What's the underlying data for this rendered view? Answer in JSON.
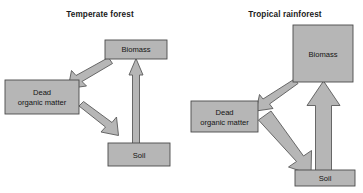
{
  "figure": {
    "type": "diagram",
    "width": 363,
    "height": 193,
    "background_color": "#ffffff",
    "box_fill_color": "#b6b6b6",
    "box_border_color": "#4a4a4a",
    "arrow_fill_color": "#b6b6b6",
    "arrow_border_color": "#5a5a5a"
  },
  "panels": [
    {
      "id": "temperate",
      "title": "Temperate forest",
      "title_x": 100,
      "title_y": 17,
      "boxes": [
        {
          "id": "temperate-biomass",
          "label": "Biomass",
          "lines": [
            "Biomass"
          ],
          "x": 105,
          "y": 40,
          "w": 62,
          "h": 19,
          "relative_size": "small"
        },
        {
          "id": "temperate-dead-organic-matter",
          "label": "Dead organic matter",
          "lines": [
            "Dead",
            "organic matter"
          ],
          "x": 5,
          "y": 80,
          "w": 74,
          "h": 34,
          "relative_size": "medium"
        },
        {
          "id": "temperate-soil",
          "label": "Soil",
          "lines": [
            "Soil"
          ],
          "x": 108,
          "y": 143,
          "w": 62,
          "h": 23,
          "relative_size": "medium"
        }
      ],
      "arrows": [
        {
          "id": "temperate-biomass-to-dead-organic-matter",
          "from": "Biomass",
          "to": "Dead organic matter",
          "direction": "down-left",
          "thickness": "thin",
          "shaft_width": 7
        },
        {
          "id": "temperate-dead-organic-matter-to-soil",
          "from": "Dead organic matter",
          "to": "Soil",
          "direction": "down-right",
          "thickness": "thin",
          "shaft_width": 7
        },
        {
          "id": "temperate-soil-to-biomass",
          "from": "Soil",
          "to": "Biomass",
          "direction": "up",
          "thickness": "thin",
          "shaft_width": 6
        }
      ]
    },
    {
      "id": "tropical",
      "title": "Tropical rainforest",
      "title_x": 285,
      "title_y": 17,
      "boxes": [
        {
          "id": "tropical-biomass",
          "label": "Biomass",
          "lines": [
            "Biomass"
          ],
          "x": 293,
          "y": 25,
          "w": 60,
          "h": 57,
          "relative_size": "large"
        },
        {
          "id": "tropical-dead-organic-matter",
          "label": "Dead organic matter",
          "lines": [
            "Dead",
            "organic matter"
          ],
          "x": 191,
          "y": 101,
          "w": 67,
          "h": 31,
          "relative_size": "medium"
        },
        {
          "id": "tropical-soil",
          "label": "Soil",
          "lines": [
            "Soil"
          ],
          "x": 295,
          "y": 170,
          "w": 60,
          "h": 16,
          "relative_size": "small"
        }
      ],
      "arrows": [
        {
          "id": "tropical-biomass-to-dead-organic-matter",
          "from": "Biomass",
          "to": "Dead organic matter",
          "direction": "down-left",
          "thickness": "thin",
          "shaft_width": 5
        },
        {
          "id": "tropical-dead-organic-matter-to-soil",
          "from": "Dead organic matter",
          "to": "Soil",
          "direction": "down-right",
          "thickness": "thick",
          "shaft_width": 16
        },
        {
          "id": "tropical-soil-to-biomass",
          "from": "Soil",
          "to": "Biomass",
          "direction": "up",
          "thickness": "thick",
          "shaft_width": 17
        }
      ]
    }
  ]
}
